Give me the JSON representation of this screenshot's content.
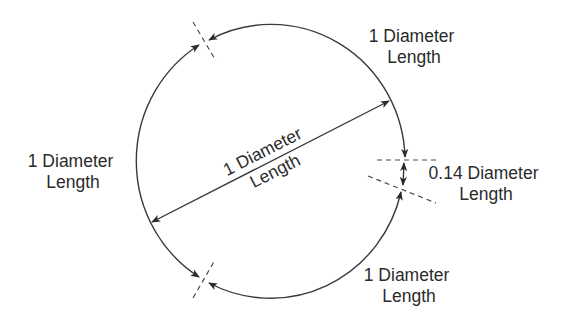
{
  "diagram": {
    "labels": {
      "top_right": {
        "line1": "1 Diameter",
        "line2": "Length"
      },
      "left": {
        "line1": "1 Diameter",
        "line2": "Length"
      },
      "center": {
        "line1": "1 Diameter",
        "line2": "Length"
      },
      "bottom_right": {
        "line1": "1 Diameter",
        "line2": "Length"
      },
      "gap": {
        "line1": "0.14 Diameter",
        "line2": "Length"
      }
    },
    "segments": [
      {
        "name": "top-right-arc",
        "length": "1 diameter"
      },
      {
        "name": "left-arc",
        "length": "1 diameter"
      },
      {
        "name": "bottom-right-arc",
        "length": "1 diameter"
      },
      {
        "name": "remaining-gap",
        "length": "0.14 diameter"
      }
    ],
    "colors": {
      "stroke": "#3a3a3a",
      "text": "#2b2b2b",
      "background": "#ffffff"
    }
  }
}
